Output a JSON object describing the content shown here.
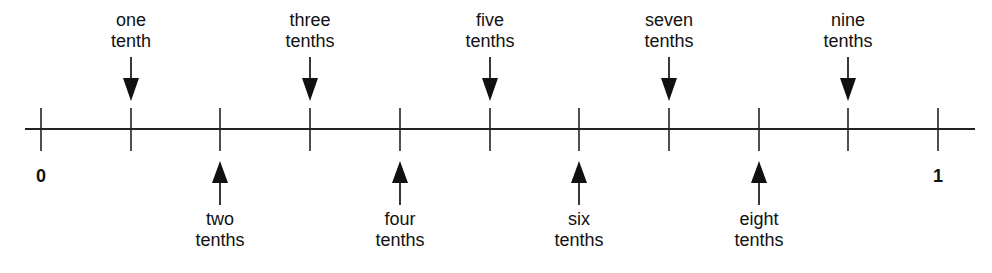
{
  "diagram": {
    "title": "",
    "number_line": {
      "start_label": "0",
      "end_label": "1",
      "ticks": 11,
      "x_start": 41,
      "x_end": 938,
      "y": 129,
      "line_from": 25,
      "line_to": 975
    },
    "labels": [
      {
        "value": 0.1,
        "line1": "one",
        "line2": "tenth",
        "side": "above"
      },
      {
        "value": 0.2,
        "line1": "two",
        "line2": "tenths",
        "side": "below"
      },
      {
        "value": 0.3,
        "line1": "three",
        "line2": "tenths",
        "side": "above"
      },
      {
        "value": 0.4,
        "line1": "four",
        "line2": "tenths",
        "side": "below"
      },
      {
        "value": 0.5,
        "line1": "five",
        "line2": "tenths",
        "side": "above"
      },
      {
        "value": 0.6,
        "line1": "six",
        "line2": "tenths",
        "side": "below"
      },
      {
        "value": 0.7,
        "line1": "seven",
        "line2": "tenths",
        "side": "above"
      },
      {
        "value": 0.8,
        "line1": "eight",
        "line2": "tenths",
        "side": "below"
      },
      {
        "value": 0.9,
        "line1": "nine",
        "line2": "tenths",
        "side": "above"
      }
    ]
  }
}
